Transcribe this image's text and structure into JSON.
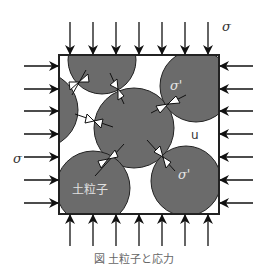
{
  "diagram": {
    "labels": {
      "total_stress_top": "σ",
      "total_stress_left": "σ",
      "effective_stress_1": "σ'",
      "effective_stress_2": "σ'",
      "pore_pressure": "u",
      "soil_particle": "土粒子"
    },
    "caption": "図  土粒子と応力",
    "colors": {
      "particle_fill": "#6b6b6b",
      "outline": "#222222",
      "background": "#ffffff"
    }
  }
}
